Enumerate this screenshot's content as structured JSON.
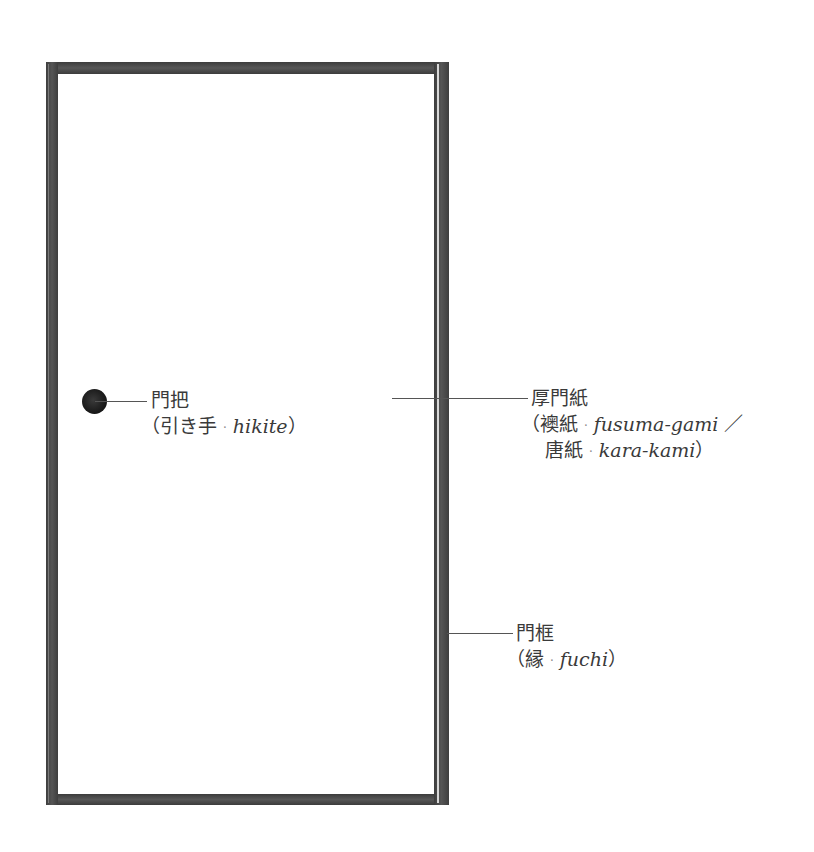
{
  "diagram": {
    "colors": {
      "frame": "#4a4a4a",
      "paper": "#ffffff",
      "handle": "#1a1a1a",
      "text": "#3a3a3a",
      "leader_line": "#555555"
    },
    "labels": {
      "handle": {
        "title": "門把",
        "open_paren": "（",
        "jp": "引き手",
        "separator": "·",
        "romaji": "hikite",
        "close_paren": "）"
      },
      "paper": {
        "title": "厚門紙",
        "line2": {
          "open_paren": "（",
          "jp": "襖紙",
          "separator": "·",
          "romaji": "fusuma-gami",
          "slash": "／"
        },
        "line3": {
          "jp": "唐紙",
          "separator": "·",
          "romaji": "kara-kami",
          "close_paren": "）"
        }
      },
      "frame": {
        "title": "門框",
        "open_paren": "（",
        "jp": "縁",
        "separator": "·",
        "romaji": "fuchi",
        "close_paren": "）"
      }
    }
  }
}
